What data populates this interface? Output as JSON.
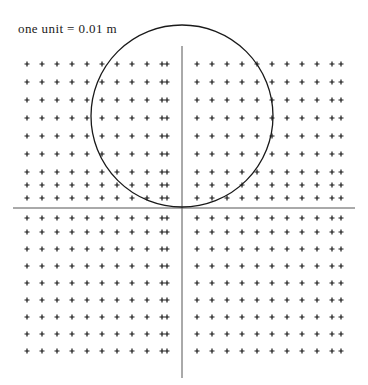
{
  "figure": {
    "title": "",
    "background_color": "#ffffff",
    "width": 368,
    "height": 385,
    "annotation": {
      "text": "one unit = 0.01 m",
      "x": 18,
      "y": 22,
      "color": "#1a1a1a"
    }
  },
  "chart_data": {
    "type": "scatter",
    "title": "",
    "subtitle": "",
    "xlabel": "",
    "ylabel": "",
    "annotations": [
      "one unit = 0.01 m"
    ],
    "grid": false,
    "legend": null,
    "unit_label": "one unit = 0.01 m",
    "unit_value": 0.01,
    "unit_name": "m",
    "axes": {
      "origin_px": [
        182,
        208
      ],
      "x_axis": {
        "x1": 13,
        "y1": 208,
        "x2": 355,
        "y2": 208,
        "color": "#555555",
        "width": 1
      },
      "y_axis": {
        "x1": 182,
        "y1": 46,
        "x2": 182,
        "y2": 378,
        "color": "#555555",
        "width": 1
      },
      "xlim": [
        -11,
        11
      ],
      "ylim": [
        -9,
        9
      ]
    },
    "marker": {
      "shape": "plus",
      "size_px": 5,
      "color": "#1a1a1a",
      "stroke_width": 1.2
    },
    "grid_points": {
      "spacing_px": 30,
      "columns": 22,
      "rows": 18,
      "x_offsets_units": [
        -11,
        -10,
        -9,
        -8,
        -7,
        -6,
        -5,
        -4,
        -3,
        -2,
        -1,
        1,
        2,
        3,
        4,
        5,
        6,
        7,
        8,
        9,
        10,
        11
      ],
      "y_offsets_units": [
        9,
        8,
        7,
        6,
        5,
        4,
        3,
        2,
        1,
        -1,
        -2,
        -3,
        -4,
        -5,
        -6,
        -7,
        -8,
        -9
      ],
      "x_px": [
        27,
        42,
        57,
        72,
        87,
        102,
        117,
        132,
        147,
        162,
        167,
        197,
        212,
        227,
        242,
        257,
        272,
        287,
        302,
        317,
        332,
        341
      ],
      "y_px": [
        64,
        82,
        100,
        118,
        136,
        154,
        172,
        185,
        198,
        218,
        232,
        249,
        266,
        283,
        300,
        317,
        334,
        351
      ]
    },
    "circle": {
      "center_px": [
        182,
        116
      ],
      "center_units": [
        0,
        4.9
      ],
      "radius_px": 91,
      "radius_units": 4.9,
      "diameter_units": 9.8,
      "radius_meters": 0.049,
      "diameter_meters": 0.098,
      "stroke": "#1a1a1a",
      "stroke_width": 1.3,
      "fill": "none",
      "tangent_to": "x-axis"
    }
  }
}
